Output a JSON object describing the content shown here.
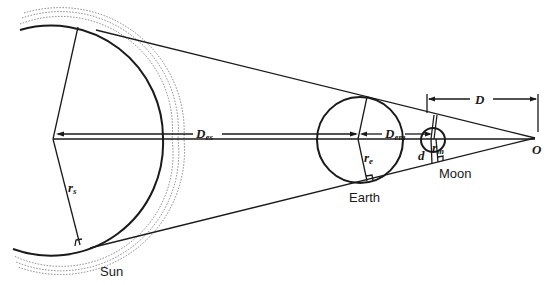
{
  "diagram": {
    "colors": {
      "line": "#1a1a1a",
      "background": "#ffffff"
    },
    "labels": {
      "sun": "Sun",
      "earth": "Earth",
      "moon": "Moon",
      "origin": "O",
      "d_es_main": "D",
      "d_es_sub": "es",
      "d_em_main": "D",
      "d_em_sub": "em",
      "d_main": "D",
      "r_s_main": "r",
      "r_s_sub": "s",
      "r_e_main": "r",
      "r_e_sub": "e",
      "r_m_main": "r",
      "r_m_sub": "m",
      "d_small": "d"
    },
    "bodies": [
      {
        "name": "Sun",
        "cx": 53,
        "cy": 139,
        "r": 110
      },
      {
        "name": "Earth",
        "cx": 360,
        "cy": 140,
        "r": 43
      },
      {
        "name": "Moon",
        "cx": 433,
        "cy": 140,
        "r": 12
      }
    ],
    "apex": {
      "name": "O",
      "x": 535,
      "y": 138
    }
  }
}
